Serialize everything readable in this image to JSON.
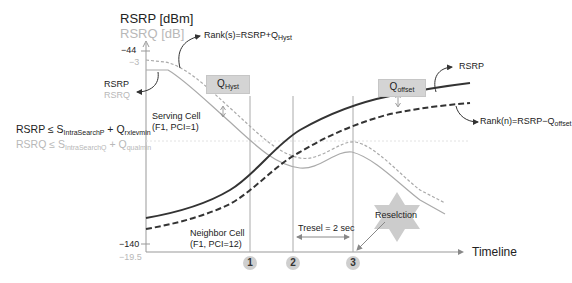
{
  "axes": {
    "y_title_primary": "RSRP [dBm]",
    "y_title_secondary": "RSRQ [dB]",
    "y_top_tick_rsrp": "−44",
    "y_top_tick_rsrq": "−3",
    "y_bottom_tick_rsrp": "−140",
    "y_bottom_tick_rsrq": "−19.5",
    "x_title": "Timeline"
  },
  "left_labels": {
    "rsrp": "RSRP",
    "rsrq": "RSRQ"
  },
  "thresholds": {
    "rsrp": {
      "lhs": "RSRP ≤ S",
      "sub1": "IntraSearchP",
      "mid": " + Q",
      "sub2": "rxlevmin"
    },
    "rsrq": {
      "lhs": "RSRQ ≤ S",
      "sub1": "IntraSearchQ",
      "mid": " + Q",
      "sub2": "qualmin"
    }
  },
  "annotations": {
    "rank_s": {
      "text": "Rank(s)=RSRP+Q",
      "sub": "Hyst"
    },
    "rank_n": {
      "text": "Rank(n)=RSRP−Q",
      "sub": "offset"
    },
    "rsrp_right": "RSRP",
    "q_hyst": {
      "text": "Q",
      "sub": "Hyst"
    },
    "q_offset": {
      "text": "Q",
      "sub": "offset"
    },
    "serving_cell": {
      "line1": "Serving Cell",
      "line2": "(F1, PCI=1)"
    },
    "neighbor_cell": {
      "line1": "Neighbor Cell",
      "line2": "(F1, PCI=12)"
    },
    "tresel": "Tresel = 2 sec",
    "reselection": "Reselction"
  },
  "markers": [
    "1",
    "2",
    "3"
  ],
  "colors": {
    "primary_line": "#333333",
    "secondary_line": "#aaaaaa",
    "box_fill": "#d4d4d4",
    "star_fill": "#cccccc",
    "marker_fill": "#cfcfcf"
  }
}
